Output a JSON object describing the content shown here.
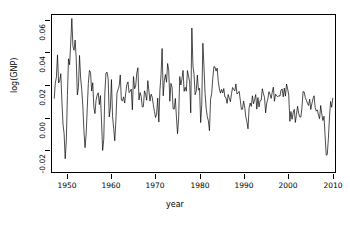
{
  "chart_data": {
    "type": "line",
    "title": "",
    "xlabel": "year",
    "ylabel": "log(GNP)",
    "xlim": [
      1946.5,
      2010.75
    ],
    "ylim": [
      -0.027,
      0.062
    ],
    "grid": false,
    "legend": null,
    "line_color": "#000000",
    "background": "#ffffff",
    "x_ticks": [
      1950,
      1960,
      1970,
      1980,
      1990,
      2000,
      2010
    ],
    "x_tick_labels": [
      "1950",
      "1960",
      "1970",
      "1980",
      "1990",
      "2000",
      "2010"
    ],
    "y_ticks": [
      -0.02,
      0.0,
      0.02,
      0.04,
      0.06
    ],
    "y_tick_labels": [
      "-0.02",
      "0.00",
      "0.02",
      "0.04",
      "0.06"
    ],
    "series": [
      {
        "name": "log(GNP) quarterly growth",
        "x": [
          1947.0,
          1947.25,
          1947.5,
          1947.75,
          1948.0,
          1948.25,
          1948.5,
          1948.75,
          1949.0,
          1949.25,
          1949.5,
          1949.75,
          1950.0,
          1950.25,
          1950.5,
          1950.75,
          1951.0,
          1951.25,
          1951.5,
          1951.75,
          1952.0,
          1952.25,
          1952.5,
          1952.75,
          1953.0,
          1953.25,
          1953.5,
          1953.75,
          1954.0,
          1954.25,
          1954.5,
          1954.75,
          1955.0,
          1955.25,
          1955.5,
          1955.75,
          1956.0,
          1956.25,
          1956.5,
          1956.75,
          1957.0,
          1957.25,
          1957.5,
          1957.75,
          1958.0,
          1958.25,
          1958.5,
          1958.75,
          1959.0,
          1959.25,
          1959.5,
          1959.75,
          1960.0,
          1960.25,
          1960.5,
          1960.75,
          1961.0,
          1961.25,
          1961.5,
          1961.75,
          1962.0,
          1962.25,
          1962.5,
          1962.75,
          1963.0,
          1963.25,
          1963.5,
          1963.75,
          1964.0,
          1964.25,
          1964.5,
          1964.75,
          1965.0,
          1965.25,
          1965.5,
          1965.75,
          1966.0,
          1966.25,
          1966.5,
          1966.75,
          1967.0,
          1967.25,
          1967.5,
          1967.75,
          1968.0,
          1968.25,
          1968.5,
          1968.75,
          1969.0,
          1969.25,
          1969.5,
          1969.75,
          1970.0,
          1970.25,
          1970.5,
          1970.75,
          1971.0,
          1971.25,
          1971.5,
          1971.75,
          1972.0,
          1972.25,
          1972.5,
          1972.75,
          1973.0,
          1973.25,
          1973.5,
          1973.75,
          1974.0,
          1974.25,
          1974.5,
          1974.75,
          1975.0,
          1975.25,
          1975.5,
          1975.75,
          1976.0,
          1976.25,
          1976.5,
          1976.75,
          1977.0,
          1977.25,
          1977.5,
          1977.75,
          1978.0,
          1978.25,
          1978.5,
          1978.75,
          1979.0,
          1979.25,
          1979.5,
          1979.75,
          1980.0,
          1980.25,
          1980.5,
          1980.75,
          1981.0,
          1981.25,
          1981.5,
          1981.75,
          1982.0,
          1982.25,
          1982.5,
          1982.75,
          1983.0,
          1983.25,
          1983.5,
          1983.75,
          1984.0,
          1984.25,
          1984.5,
          1984.75,
          1985.0,
          1985.25,
          1985.5,
          1985.75,
          1986.0,
          1986.25,
          1986.5,
          1986.75,
          1987.0,
          1987.25,
          1987.5,
          1987.75,
          1988.0,
          1988.25,
          1988.5,
          1988.75,
          1989.0,
          1989.25,
          1989.5,
          1989.75,
          1990.0,
          1990.25,
          1990.5,
          1990.75,
          1991.0,
          1991.25,
          1991.5,
          1991.75,
          1992.0,
          1992.25,
          1992.5,
          1992.75,
          1993.0,
          1993.25,
          1993.5,
          1993.75,
          1994.0,
          1994.25,
          1994.5,
          1994.75,
          1995.0,
          1995.25,
          1995.5,
          1995.75,
          1996.0,
          1996.25,
          1996.5,
          1996.75,
          1997.0,
          1997.25,
          1997.5,
          1997.75,
          1998.0,
          1998.25,
          1998.5,
          1998.75,
          1999.0,
          1999.25,
          1999.5,
          1999.75,
          2000.0,
          2000.25,
          2000.5,
          2000.75,
          2001.0,
          2001.25,
          2001.5,
          2001.75,
          2002.0,
          2002.25,
          2002.5,
          2002.75,
          2003.0,
          2003.25,
          2003.5,
          2003.75,
          2004.0,
          2004.25,
          2004.5,
          2004.75,
          2005.0,
          2005.25,
          2005.5,
          2005.75,
          2006.0,
          2006.25,
          2006.5,
          2006.75,
          2007.0,
          2007.25,
          2007.5,
          2007.75,
          2008.0,
          2008.25,
          2008.5,
          2008.75,
          2009.0,
          2009.25,
          2009.5,
          2009.75,
          2010.0,
          2010.25
        ],
        "values": [
          0.0148,
          0.0233,
          0.0268,
          0.0394,
          0.0235,
          0.0247,
          0.0287,
          0.0128,
          0.0002,
          -0.0053,
          -0.0195,
          -0.0092,
          0.0164,
          0.0372,
          0.0338,
          0.0461,
          0.06,
          0.0443,
          0.042,
          0.0478,
          0.0374,
          0.0167,
          0.021,
          0.0391,
          0.0263,
          0.0198,
          0.0105,
          -0.0038,
          -0.0132,
          -0.0057,
          0.0089,
          0.0232,
          0.0306,
          0.0295,
          0.0189,
          0.0236,
          0.0097,
          0.0061,
          0.0137,
          0.0166,
          0.0179,
          0.0112,
          0.0163,
          0.0014,
          -0.0148,
          -0.0085,
          0.0178,
          0.0291,
          0.0296,
          0.0259,
          0.0042,
          0.0092,
          0.0254,
          0.0044,
          -0.0022,
          -0.0093,
          0.0021,
          0.0178,
          0.0198,
          0.0218,
          0.028,
          0.0137,
          0.0133,
          0.0156,
          0.0121,
          0.018,
          0.0226,
          0.0241,
          0.018,
          0.0188,
          0.02,
          0.0083,
          0.0271,
          0.0202,
          0.0218,
          0.029,
          0.0321,
          0.0138,
          0.018,
          0.0159,
          0.0098,
          0.0101,
          0.019,
          0.0171,
          0.0137,
          0.0248,
          0.019,
          0.0132,
          0.0171,
          0.0155,
          0.0112,
          0.0074,
          0.0039,
          0.0059,
          0.0149,
          0.0013,
          0.0194,
          0.0281,
          0.043,
          0.0162,
          0.0247,
          0.0283,
          0.0239,
          0.0345,
          0.0306,
          0.0131,
          0.0232,
          0.0211,
          0.0088,
          0.0087,
          0.0147,
          0.0042,
          -0.0053,
          0.0036,
          0.0271,
          0.0223,
          0.0258,
          0.0306,
          0.0187,
          0.021,
          0.0188,
          0.0305,
          0.0273,
          0.0241,
          0.0065,
          0.0546,
          0.033,
          0.0285,
          0.0168,
          0.0188,
          0.0279,
          0.0194,
          0.0205,
          0.001,
          0.0111,
          0.046,
          0.0326,
          0.0177,
          0.0091,
          0.0045,
          0.002,
          -0.0036,
          0.0142,
          0.0174,
          0.0261,
          0.0327,
          0.0325,
          0.0302,
          0.0319,
          0.0244,
          0.0201,
          0.0177,
          0.0198,
          0.0178,
          0.0203,
          0.0155,
          0.0151,
          0.0119,
          0.0169,
          0.0148,
          0.0129,
          0.0173,
          0.0209,
          0.0198,
          0.019,
          0.0229,
          0.0172,
          0.0178,
          0.0187,
          0.0137,
          0.0085,
          0.0086,
          0.0132,
          0.0098,
          0.0043,
          0.0014,
          -0.0025,
          0.0093,
          0.0121,
          0.0102,
          0.0162,
          0.0117,
          0.0141,
          0.0169,
          0.0086,
          0.0152,
          0.0099,
          0.0135,
          0.0137,
          0.0202,
          0.0174,
          0.0152,
          0.0065,
          0.0121,
          0.0143,
          0.0185,
          0.0171,
          0.0147,
          0.0182,
          0.0211,
          0.0131,
          0.0171,
          0.0161,
          0.0156,
          0.0163,
          0.016,
          0.0195,
          0.0201,
          0.0156,
          0.0206,
          0.016,
          0.0229,
          0.0201,
          0.0166,
          0.0017,
          0.0073,
          0.0029,
          0.0065,
          0.0085,
          0.0011,
          0.0057,
          0.0103,
          0.0062,
          0.0043,
          0.0041,
          0.0095,
          0.0186,
          0.0184,
          0.0152,
          0.0137,
          0.012,
          0.0107,
          0.0143,
          0.0084,
          0.0117,
          0.0145,
          0.0162,
          0.0096,
          0.0075,
          0.0082,
          0.0052,
          0.0032,
          0.0107,
          0.0059,
          0.0022,
          0.0046,
          -0.0062,
          -0.0175,
          -0.0171,
          -0.0078,
          0.0042,
          0.013,
          0.0097,
          0.0148
        ]
      }
    ],
    "annotations": []
  },
  "axes": {
    "y_title": "log(GNP)",
    "x_title": "year",
    "y_tick_labels": [
      "0.06",
      "0.04",
      "0.02",
      "0.00",
      "-0.02"
    ],
    "x_tick_labels": [
      "1950",
      "1960",
      "1970",
      "1980",
      "1990",
      "2000",
      "2010"
    ]
  }
}
